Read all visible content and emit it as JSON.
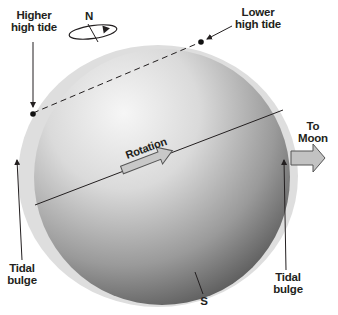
{
  "diagram": {
    "type": "tidal-bulge-earth",
    "colors": {
      "bulge": "#dcdcdc",
      "sphere_light": "#f4f4f4",
      "sphere_dark": "#5a5a5a",
      "line": "#231f20",
      "arrow_fill": "#c2c2c2",
      "arrow_stroke": "#555555"
    },
    "labels": {
      "north": "N",
      "south": "S",
      "higher_high_tide": [
        "Higher",
        "high tide"
      ],
      "lower_high_tide": [
        "Lower",
        "high tide"
      ],
      "rotation": "Rotation",
      "to_moon": [
        "To",
        "Moon"
      ],
      "tidal_bulge_left": [
        "Tidal",
        "bulge"
      ],
      "tidal_bulge_right": [
        "Tidal",
        "bulge"
      ]
    }
  }
}
